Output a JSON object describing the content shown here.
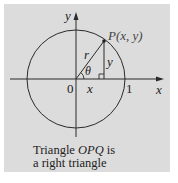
{
  "figure": {
    "axes": {
      "x_label": "x",
      "y_label": "y",
      "origin_label": "0",
      "unit_tick_label": "1"
    },
    "circle": {
      "type": "unit circle",
      "center": "O",
      "radius": 1
    },
    "point": {
      "label": "P(x, y)"
    },
    "triangle": {
      "hypotenuse_label": "r",
      "vertical_leg_label": "y",
      "horizontal_leg_label": "x",
      "angle_label": "θ",
      "right_angle_marker": true
    },
    "caption": {
      "line1_prefix": "Triangle ",
      "line1_emph": "OPQ",
      "line1_suffix": " is",
      "line2": "a right triangle"
    },
    "colors": {
      "panel_background": "#dcdcdc",
      "stroke": "#222222"
    }
  }
}
